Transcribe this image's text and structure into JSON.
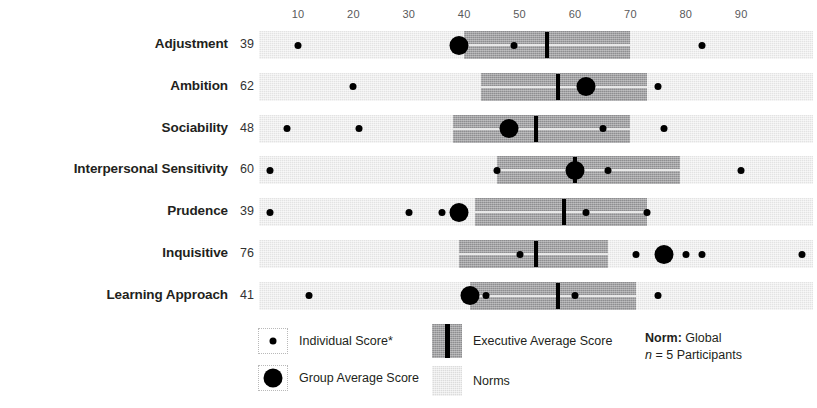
{
  "chart_data": {
    "type": "bar",
    "title": "",
    "xlabel": "",
    "ylabel": "",
    "xlim": [
      3,
      103
    ],
    "axis_ticks": [
      10,
      20,
      30,
      40,
      50,
      60,
      70,
      80,
      90
    ],
    "grid": false,
    "legend_position": "bottom",
    "categories": [
      "Adjustment",
      "Ambition",
      "Sociability",
      "Interpersonal Sensitivity",
      "Prudence",
      "Inquisitive",
      "Learning Approach"
    ],
    "series": [
      {
        "name": "Group Average Score",
        "values": [
          39,
          62,
          48,
          60,
          39,
          76,
          41
        ]
      },
      {
        "name": "Executive Average Score",
        "values": [
          55,
          57,
          53,
          60,
          58,
          53,
          57
        ]
      }
    ],
    "rows": [
      {
        "label": "Adjustment",
        "score": 39,
        "group_average": 39,
        "executive_band": [
          40,
          70
        ],
        "executive_average": 55,
        "norm_band": [
          3,
          103
        ],
        "individual_scores": [
          10,
          49,
          83
        ]
      },
      {
        "label": "Ambition",
        "score": 62,
        "group_average": 62,
        "executive_band": [
          43,
          73
        ],
        "executive_average": 57,
        "norm_band": [
          3,
          103
        ],
        "individual_scores": [
          20,
          75
        ]
      },
      {
        "label": "Sociability",
        "score": 48,
        "group_average": 48,
        "executive_band": [
          38,
          70
        ],
        "executive_average": 53,
        "norm_band": [
          3,
          103
        ],
        "individual_scores": [
          8,
          21,
          65,
          76
        ]
      },
      {
        "label": "Interpersonal Sensitivity",
        "score": 60,
        "group_average": 60,
        "executive_band": [
          46,
          79
        ],
        "executive_average": 60,
        "norm_band": [
          3,
          103
        ],
        "individual_scores": [
          5,
          46,
          66,
          90
        ]
      },
      {
        "label": "Prudence",
        "score": 39,
        "group_average": 39,
        "executive_band": [
          42,
          73
        ],
        "executive_average": 58,
        "norm_band": [
          3,
          103
        ],
        "individual_scores": [
          5,
          30,
          36,
          62,
          73
        ]
      },
      {
        "label": "Inquisitive",
        "score": 76,
        "group_average": 76,
        "executive_band": [
          39,
          66
        ],
        "executive_average": 53,
        "norm_band": [
          3,
          103
        ],
        "individual_scores": [
          50,
          71,
          80,
          83,
          101
        ]
      },
      {
        "label": "Learning Approach",
        "score": 41,
        "group_average": 41,
        "executive_band": [
          41,
          71
        ],
        "executive_average": 57,
        "norm_band": [
          3,
          103
        ],
        "individual_scores": [
          12,
          44,
          60,
          75
        ]
      }
    ]
  },
  "legend": {
    "individual_score": "Individual Score*",
    "group_average_score": "Group Average Score",
    "executive_average_score": "Executive Average Score",
    "norms": "Norms",
    "norm_label": "Norm:",
    "norm_value": "Global",
    "n_symbol": "n",
    "n_text": "= 5 Participants"
  },
  "colors": {
    "norm_band": "#e3e3e3",
    "executive_band": "#8e8e90",
    "marker": "#000000",
    "text": "#231f20",
    "axis_text": "#59595b"
  }
}
